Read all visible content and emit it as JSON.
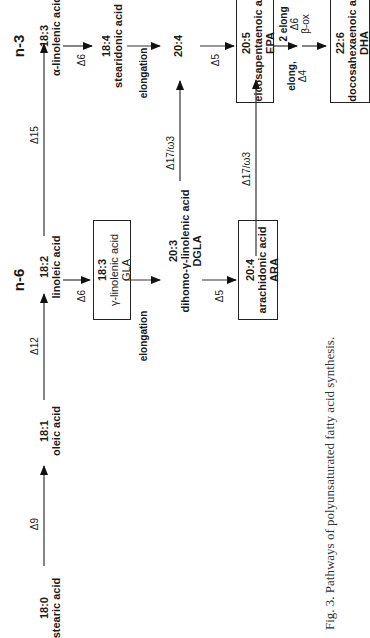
{
  "headings": {
    "n6": "n-6",
    "n3": "n-3"
  },
  "nodes": {
    "stearic": {
      "code": "18:0",
      "name": "stearic acid"
    },
    "oleic": {
      "code": "18:1",
      "name": "oleic acid"
    },
    "linoleic": {
      "code": "18:2",
      "name": "linoleic acid"
    },
    "gla": {
      "code": "18:3",
      "name": "γ-linolenic acid",
      "abbr": "GLA"
    },
    "dgla": {
      "code": "20:3",
      "name": "dihomo-γ-linolenic acid",
      "abbr": "DGLA"
    },
    "ara": {
      "code": "20:4",
      "name": "arachidonic acid",
      "abbr": "ARA"
    },
    "ala": {
      "code": "18:3",
      "name": "α-linolenic acid"
    },
    "sda": {
      "code": "18:4",
      "name": "stearidonic acid"
    },
    "eta": {
      "code": "20:4"
    },
    "epa": {
      "code": "20:5",
      "name": "eicosapentaenoic acid",
      "abbr": "EPA"
    },
    "dha": {
      "code": "22:6",
      "name": "docosahexaenoic acid",
      "abbr": "DHA"
    }
  },
  "enzymes": {
    "d9": "Δ9",
    "d12": "Δ12",
    "d15": "Δ15",
    "d6_n6": "Δ6",
    "elong_n6": "elongation",
    "d5_n6": "Δ5",
    "d17_dgla": "Δ17/ω3",
    "d17_ara": "Δ17/ω3",
    "d6_n3": "Δ6",
    "elong_n3": "elongation",
    "d5_n3": "Δ5",
    "elong_d4_a": "elong,",
    "elong_d4_b": "Δ4",
    "two_elong_a": "2 elong",
    "two_elong_b": "Δ6",
    "two_elong_c": "β-ox"
  },
  "caption": "Fig. 3. Pathways of polyunsaturated fatty acid synthesis."
}
